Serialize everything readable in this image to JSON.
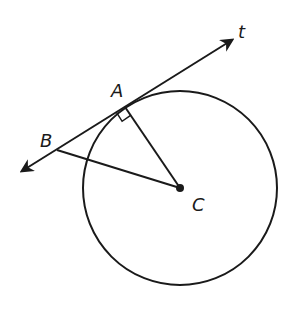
{
  "diagram": {
    "type": "geometry",
    "colors": {
      "stroke": "#1a1a1a",
      "background": "#ffffff"
    },
    "circle": {
      "center_label": "C",
      "cx": 180,
      "cy": 188,
      "r": 97
    },
    "line_t": {
      "label": "t",
      "x1": 22,
      "y1": 171,
      "x2": 232,
      "y2": 40,
      "arrows": "both"
    },
    "points": [
      {
        "label": "A",
        "x": 125,
        "y": 107,
        "label_x": 112,
        "label_y": 96
      },
      {
        "label": "B",
        "x": 57,
        "y": 150,
        "label_x": 40,
        "label_y": 145
      },
      {
        "label": "C",
        "x": 180,
        "y": 188,
        "label_x": 192,
        "label_y": 212
      }
    ],
    "segments": [
      {
        "from": "A",
        "to": "C"
      },
      {
        "from": "B",
        "to": "C"
      }
    ],
    "right_angle_marker": {
      "at": "A"
    },
    "labels": {
      "t": "t",
      "A": "A",
      "B": "B",
      "C": "C"
    }
  }
}
